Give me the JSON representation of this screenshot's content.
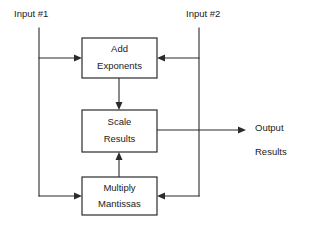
{
  "diagram": {
    "line_color": "#2b2b2b",
    "background_color": "#ffffff",
    "boxes": [
      {
        "id": "add-exponents",
        "line1": "Add",
        "line2": "Exponents",
        "x": 82,
        "y": 38,
        "width": 75,
        "height": 40
      },
      {
        "id": "scale-results",
        "line1": "Scale",
        "line2": "Results",
        "x": 82,
        "y": 110,
        "width": 75,
        "height": 42
      },
      {
        "id": "multiply-mantissas",
        "line1": "Multiply",
        "line2": "Mantissas",
        "x": 82,
        "y": 177,
        "width": 75,
        "height": 38
      }
    ],
    "io_labels": [
      {
        "id": "input-1",
        "text": "Input #1",
        "x": 14,
        "y": 14
      },
      {
        "id": "input-2",
        "text": "Input #2",
        "x": 186,
        "y": 14
      },
      {
        "id": "output-line-1",
        "text": "Output",
        "x": 255,
        "y": 128
      },
      {
        "id": "output-line-2",
        "text": "Results",
        "x": 255,
        "y": 152
      }
    ]
  }
}
